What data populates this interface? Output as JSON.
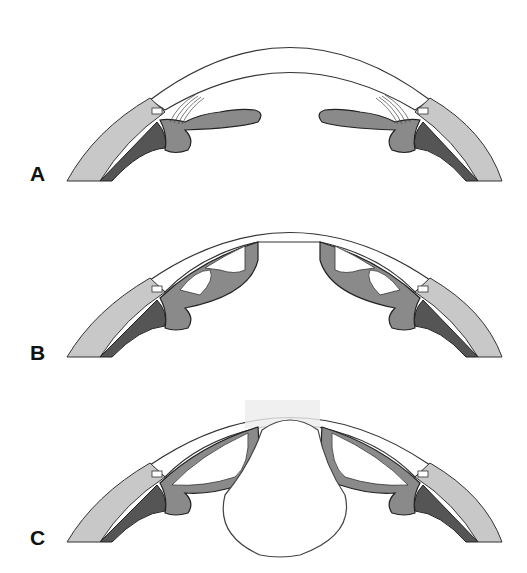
{
  "figure": {
    "panels": [
      {
        "id": "A",
        "label": "A",
        "description": "Anterior segment with ciliary body/iris in resting position, lens absent"
      },
      {
        "id": "B",
        "label": "B",
        "description": "Ciliary body tissue attached to posterior cornea, central opening"
      },
      {
        "id": "C",
        "label": "C",
        "description": "Ciliary tissue attached to cornea with round lens-like body centrally"
      }
    ],
    "colors": {
      "sclera": "#c8c8c8",
      "cornea": "#ffffff",
      "uvea_mid": "#8a8a8a",
      "uvea_dark": "#555555",
      "outline": "#222222",
      "haze": "#ececec"
    }
  }
}
